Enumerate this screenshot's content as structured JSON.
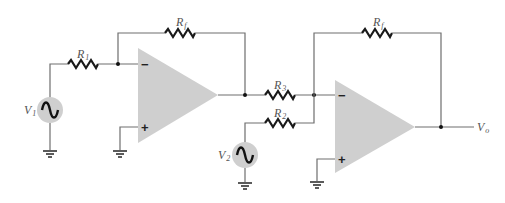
{
  "diagram": {
    "type": "circuit",
    "stage1": {
      "input_source": {
        "label": "V",
        "subscript": "1"
      },
      "input_resistor": {
        "label": "R",
        "subscript": "1"
      },
      "feedback_resistor": {
        "label": "R",
        "subscript": "f"
      },
      "inverting_input": "−",
      "noninverting_input": "+"
    },
    "stage2": {
      "input_resistor_a": {
        "label": "R",
        "subscript": "3"
      },
      "input_resistor_b": {
        "label": "R",
        "subscript": "2"
      },
      "input_source": {
        "label": "V",
        "subscript": "2"
      },
      "feedback_resistor": {
        "label": "R",
        "subscript": "f"
      },
      "inverting_input": "−",
      "noninverting_input": "+"
    },
    "output": {
      "label": "V",
      "subscript": "o"
    }
  },
  "colors": {
    "opamp_fill": "#cfcfcf",
    "wire": "#6e6e6e",
    "resistor": "#1a1a1a"
  }
}
